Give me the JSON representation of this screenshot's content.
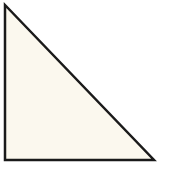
{
  "diagram": {
    "shape": "right-triangle",
    "vertices": {
      "top_left": [
        5,
        5
      ],
      "bottom_left": [
        5,
        160
      ],
      "bottom_right": [
        154,
        160
      ]
    },
    "fill_color": "#fbf8ee",
    "stroke_color": "#1a1a1a",
    "stroke_width": 2.5,
    "background_color": "#ffffff"
  }
}
